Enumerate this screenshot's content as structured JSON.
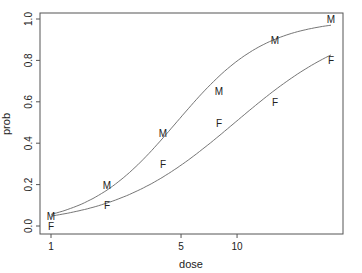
{
  "chart_data": {
    "type": "scatter",
    "title": "",
    "xlabel": "dose",
    "ylabel": "prob",
    "xscale": "log",
    "xlim": [
      0.85,
      37
    ],
    "ylim": [
      0.0,
      1.0
    ],
    "x_ticks": [
      1,
      5,
      10
    ],
    "x_tick_labels": [
      "1",
      "5",
      "10"
    ],
    "y_ticks": [
      0.0,
      0.2,
      0.4,
      0.6,
      0.8,
      1.0
    ],
    "y_tick_labels": [
      "0.0",
      "0.2",
      "0.4",
      "0.6",
      "0.8",
      "1.0"
    ],
    "grid": false,
    "legend": null,
    "x": [
      1,
      2,
      4,
      8,
      16,
      32
    ],
    "series": [
      {
        "name": "M",
        "marker": "M",
        "values": [
          0.05,
          0.2,
          0.45,
          0.65,
          0.9,
          1.0
        ],
        "fit": {
          "type": "logistic",
          "intercept": -2.82,
          "slope_log2dose": 1.26
        }
      },
      {
        "name": "F",
        "marker": "F",
        "values": [
          0.0,
          0.1,
          0.3,
          0.5,
          0.6,
          0.8
        ],
        "fit": {
          "type": "logistic",
          "intercept": -2.99,
          "slope_log2dose": 0.91
        }
      }
    ]
  },
  "colors": {
    "axis": "#555555",
    "curve": "#666666",
    "text": "#222222"
  }
}
